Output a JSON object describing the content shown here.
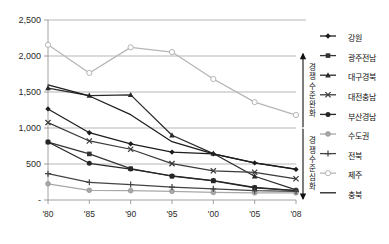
{
  "chart_data": {
    "type": "line",
    "title": "",
    "xlabel": "",
    "ylabel": "",
    "x": [
      "'80",
      "'85",
      "'90",
      "'95",
      "'00",
      "'05",
      "'08"
    ],
    "categories": [
      "'80",
      "'85",
      "'90",
      "'95",
      "'00",
      "'05",
      "'08"
    ],
    "ylim": [
      0,
      2500
    ],
    "yticks": [
      0,
      500,
      1000,
      1500,
      2000,
      2500
    ],
    "ytick_labels": [
      "-",
      "500",
      "1,000",
      "1,500",
      "2,000",
      "2,500"
    ],
    "grid": true,
    "legend_position": "right",
    "series": [
      {
        "name": "강원",
        "marker": "diamond",
        "color": "#1d1d1d",
        "values": [
          1265,
          935,
          780,
          665,
          640,
          515,
          425
        ]
      },
      {
        "name": "광주전남",
        "marker": "square",
        "color": "#333333",
        "values": [
          805,
          640,
          435,
          330,
          265,
          170,
          130
        ]
      },
      {
        "name": "대구경북",
        "marker": "triangle",
        "color": "#2a2a2a",
        "values": [
          1555,
          1450,
          1460,
          900,
          645,
          330,
          140
        ]
      },
      {
        "name": "대전충남",
        "marker": "cross-x",
        "color": "#3a3a3a",
        "values": [
          1075,
          820,
          705,
          505,
          405,
          385,
          295
        ]
      },
      {
        "name": "부산경남",
        "marker": "circle-dark",
        "color": "#262626",
        "values": [
          805,
          510,
          430,
          335,
          270,
          175,
          130
        ]
      },
      {
        "name": "수도권",
        "marker": "circle-gray",
        "color": "#a8a8a8",
        "values": [
          225,
          135,
          130,
          120,
          105,
          100,
          100
        ]
      },
      {
        "name": "전북",
        "marker": "plus",
        "color": "#444444",
        "values": [
          365,
          245,
          215,
          180,
          155,
          130,
          120
        ]
      },
      {
        "name": "제주",
        "marker": "circle-open",
        "color": "#b5b5b5",
        "values": [
          2155,
          1765,
          2120,
          2055,
          1680,
          1360,
          1180
        ]
      },
      {
        "name": "충북",
        "marker": "none",
        "color": "#1d1d1d",
        "values": [
          1600,
          1445,
          1185,
          810,
          640,
          515,
          430
        ]
      }
    ]
  },
  "annotations": {
    "upper": {
      "text": "경쟁수준완화",
      "chars": [
        "경",
        "쟁",
        "수",
        "준",
        "완",
        "화"
      ],
      "direction": "up"
    },
    "lower": {
      "text": "경쟁수준심화",
      "chars": [
        "경",
        "쟁",
        "수",
        "준",
        "심",
        "화"
      ],
      "direction": "down"
    }
  }
}
